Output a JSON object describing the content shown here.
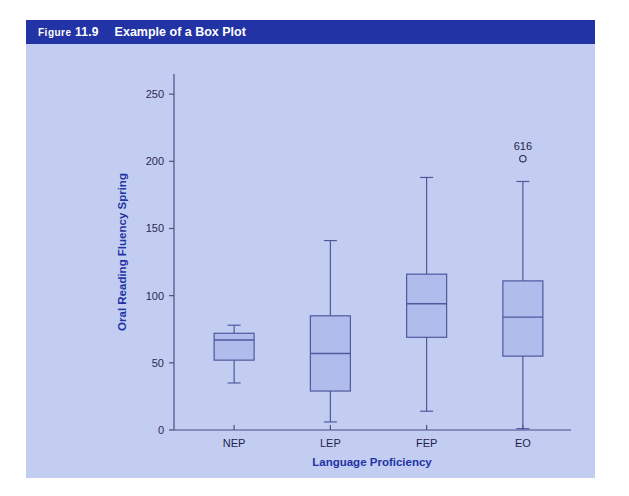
{
  "header": {
    "figure_word": "Figure",
    "figure_number": "11.9",
    "title": "Example of a Box Plot"
  },
  "colors": {
    "header_bar": "#2233a5",
    "panel_background": "#c3cdf2",
    "box_fill": "#b0bdec",
    "box_stroke": "#50589e",
    "axis": "#4a4f86",
    "axis_title_text": "#2233a5",
    "tick_text": "#2a2a55"
  },
  "chart_data": {
    "type": "box",
    "title": "Example of a Box Plot",
    "xlabel": "Language Proficiency",
    "ylabel": "Oral Reading Fluency Spring",
    "categories": [
      "NEP",
      "LEP",
      "FEP",
      "EO"
    ],
    "ylim": [
      0,
      265
    ],
    "yticks": [
      0,
      50,
      100,
      150,
      200,
      250
    ],
    "ytick_labels": [
      "0",
      "50",
      "100",
      "150",
      "200",
      "250"
    ],
    "grid": false,
    "legend": "none",
    "boxes": [
      {
        "category": "NEP",
        "whisker_low": 35,
        "q1": 52,
        "median": 67,
        "q3": 72,
        "whisker_high": 78,
        "outliers": []
      },
      {
        "category": "LEP",
        "whisker_low": 6,
        "q1": 29,
        "median": 57,
        "q3": 85,
        "whisker_high": 141,
        "outliers": []
      },
      {
        "category": "FEP",
        "whisker_low": 14,
        "q1": 69,
        "median": 94,
        "q3": 116,
        "whisker_high": 188,
        "outliers": []
      },
      {
        "category": "EO",
        "whisker_low": 1,
        "q1": 55,
        "median": 84,
        "q3": 111,
        "whisker_high": 185,
        "outliers": [
          {
            "label": "616",
            "value": 202
          }
        ]
      }
    ]
  }
}
